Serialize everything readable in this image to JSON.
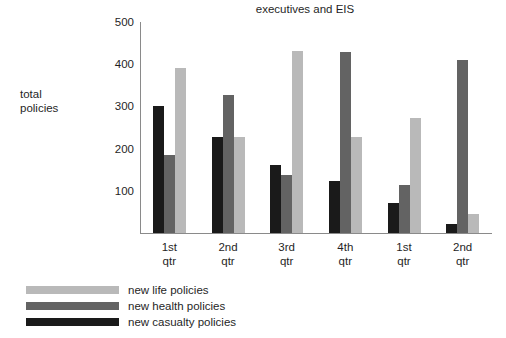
{
  "chart_data": {
    "type": "bar",
    "title": "executives and EIS",
    "xlabel": "",
    "ylabel": "total policies",
    "ylabel_lines": [
      "total",
      "policies"
    ],
    "ylim": [
      0,
      500
    ],
    "yticks": [
      100,
      200,
      300,
      400,
      500
    ],
    "ytick_labels": [
      "100",
      "200",
      "300",
      "400",
      "500"
    ],
    "grid": false,
    "legend_position": "bottom-left",
    "categories": [
      "1st qtr",
      "2nd qtr",
      "3rd qtr",
      "4th qtr",
      "1st qtr",
      "2nd qtr"
    ],
    "category_lines": [
      [
        "1st",
        "qtr"
      ],
      [
        "2nd",
        "qtr"
      ],
      [
        "3rd",
        "qtr"
      ],
      [
        "4th",
        "qtr"
      ],
      [
        "1st",
        "qtr"
      ],
      [
        "2nd",
        "qtr"
      ]
    ],
    "series": [
      {
        "name": "new casualty policies",
        "color": "#1a1a1a",
        "values": [
          300,
          228,
          160,
          123,
          70,
          22
        ]
      },
      {
        "name": "new health policies",
        "color": "#636363",
        "values": [
          185,
          328,
          138,
          430,
          113,
          410
        ]
      },
      {
        "name": "new life policies",
        "color": "#b9b9b9",
        "values": [
          390,
          228,
          432,
          228,
          272,
          45
        ]
      }
    ]
  },
  "legend": {
    "items": [
      {
        "label": "new life policies",
        "color": "#b9b9b9"
      },
      {
        "label": "new health policies",
        "color": "#636363"
      },
      {
        "label": "new casualty policies",
        "color": "#1a1a1a"
      }
    ]
  }
}
